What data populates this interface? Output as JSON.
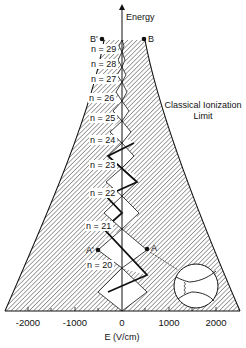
{
  "diagram": {
    "y_axis_label": "Energy",
    "x_axis_label": "E (V/cm)",
    "x_ticks": [
      {
        "value": "-2000",
        "x": 28
      },
      {
        "value": "-1000",
        "x": 75
      },
      {
        "value": "0",
        "x": 122
      },
      {
        "value": "1000",
        "x": 169
      },
      {
        "value": "2000",
        "x": 216
      }
    ],
    "limit_label_line1": "Classical Ionization",
    "limit_label_line2": "Limit",
    "points": {
      "B_prime": "B'",
      "B": "B",
      "A_prime": "A'",
      "A": "A"
    },
    "levels": [
      {
        "label": "n = 29",
        "y": 52
      },
      {
        "label": "n = 28",
        "y": 67
      },
      {
        "label": "n = 27",
        "y": 82
      },
      {
        "label": "n = 26",
        "y": 101
      },
      {
        "label": "n = 25",
        "y": 121
      },
      {
        "label": "n = 24",
        "y": 143
      },
      {
        "label": "n = 23",
        "y": 168
      },
      {
        "label": "n = 22",
        "y": 196
      },
      {
        "label": "n = 21",
        "y": 229
      },
      {
        "label": "n = 20",
        "y": 268
      }
    ],
    "colors": {
      "ink": "#111111",
      "background": "#ffffff",
      "hatch": "#333333"
    }
  }
}
